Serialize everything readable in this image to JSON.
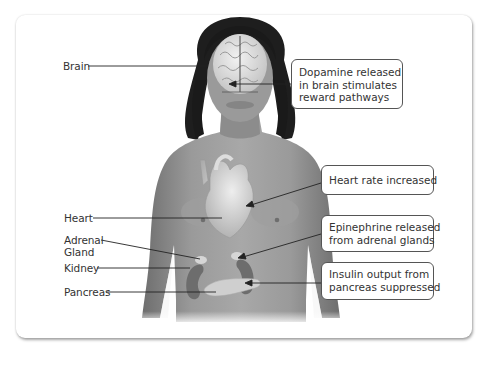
{
  "diagram": {
    "type": "anatomical-labeled-figure",
    "left_labels": [
      {
        "id": "brain",
        "text": "Brain"
      },
      {
        "id": "heart",
        "text": "Heart"
      },
      {
        "id": "adrenal",
        "lines": [
          "Adrenal",
          "Gland"
        ]
      },
      {
        "id": "kidney",
        "text": "Kidney"
      },
      {
        "id": "pancreas",
        "text": "Pancreas"
      }
    ],
    "callouts": [
      {
        "id": "dopamine",
        "lines": [
          "Dopamine released",
          "in brain stimulates",
          "reward pathways"
        ],
        "points_to": "brain"
      },
      {
        "id": "heart-rate",
        "lines": [
          "Heart rate increased"
        ],
        "points_to": "heart"
      },
      {
        "id": "epinephrine",
        "lines": [
          "Epinephrine released",
          "from adrenal glands"
        ],
        "points_to": "adrenal gland"
      },
      {
        "id": "insulin",
        "lines": [
          "Insulin output from",
          "pancreas suppressed"
        ],
        "points_to": "pancreas"
      }
    ],
    "colors": {
      "skin": "#8a8a8a",
      "hair": "#1e1e1e",
      "organ": "#d8d8d8",
      "kidney": "#6f6f6f",
      "line": "#222222",
      "text": "#333333"
    }
  }
}
